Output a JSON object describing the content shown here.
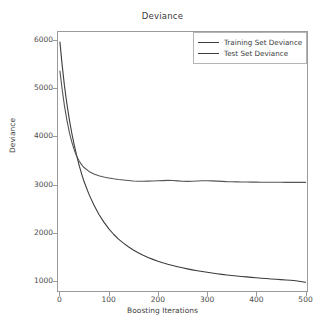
{
  "chart_data": {
    "type": "line",
    "title": "Deviance",
    "xlabel": "Boosting Iterations",
    "ylabel": "Deviance",
    "xlim": [
      -5,
      505
    ],
    "ylim": [
      780,
      6180
    ],
    "xticks": [
      "0",
      "100",
      "200",
      "300",
      "400",
      "500"
    ],
    "xtick_values": [
      0,
      100,
      200,
      300,
      400,
      500
    ],
    "yticks": [
      "1000",
      "2000",
      "3000",
      "4000",
      "5000",
      "6000"
    ],
    "ytick_values": [
      1000,
      2000,
      3000,
      4000,
      5000,
      6000
    ],
    "grid": false,
    "legend_position": "upper right",
    "x": [
      1,
      5,
      10,
      15,
      20,
      25,
      30,
      35,
      40,
      45,
      50,
      60,
      70,
      80,
      90,
      100,
      110,
      120,
      130,
      140,
      150,
      160,
      170,
      180,
      190,
      200,
      210,
      220,
      230,
      240,
      250,
      260,
      270,
      280,
      290,
      300,
      310,
      320,
      330,
      340,
      350,
      360,
      370,
      380,
      390,
      400,
      410,
      420,
      430,
      440,
      450,
      460,
      470,
      480,
      490,
      500
    ],
    "series": [
      {
        "name": "Training Set Deviance",
        "color": "#3c3c3c",
        "values": [
          5950,
          5520,
          5060,
          4680,
          4350,
          4070,
          3820,
          3600,
          3400,
          3225,
          3065,
          2800,
          2580,
          2390,
          2230,
          2090,
          1975,
          1875,
          1790,
          1715,
          1650,
          1592,
          1540,
          1495,
          1455,
          1418,
          1385,
          1355,
          1328,
          1303,
          1280,
          1258,
          1238,
          1220,
          1203,
          1187,
          1172,
          1158,
          1145,
          1133,
          1122,
          1112,
          1102,
          1092,
          1083,
          1074,
          1066,
          1058,
          1050,
          1043,
          1036,
          1029,
          1022,
          1012,
          998,
          980
        ]
      },
      {
        "name": "Test Set Deviance",
        "color": "#555555",
        "values": [
          5350,
          5010,
          4640,
          4340,
          4090,
          3885,
          3720,
          3590,
          3490,
          3415,
          3355,
          3275,
          3220,
          3185,
          3160,
          3140,
          3122,
          3108,
          3097,
          3088,
          3078,
          3072,
          3070,
          3073,
          3078,
          3082,
          3085,
          3090,
          3088,
          3079,
          3070,
          3068,
          3072,
          3078,
          3082,
          3083,
          3080,
          3074,
          3068,
          3063,
          3060,
          3058,
          3056,
          3055,
          3054,
          3053,
          3052,
          3051,
          3051,
          3050,
          3050,
          3049,
          3049,
          3048,
          3048,
          3048
        ]
      }
    ]
  },
  "legend": {
    "items": [
      {
        "label": "Training Set Deviance"
      },
      {
        "label": "Test Set Deviance"
      }
    ]
  }
}
